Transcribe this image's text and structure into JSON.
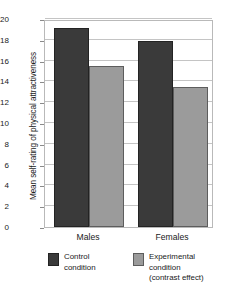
{
  "chart_data": {
    "type": "bar",
    "title": "",
    "xlabel": "",
    "ylabel": "Mean self-rating of physical attractiveness",
    "categories": [
      "Males",
      "Females"
    ],
    "series": [
      {
        "name": "Control condition",
        "values": [
          19.1,
          17.9
        ],
        "color": "#3a3a3a"
      },
      {
        "name": "Experimental condition (contrast effect)",
        "values": [
          15.5,
          13.5
        ],
        "color": "#9b9b9b"
      }
    ],
    "ylim": [
      0,
      20
    ],
    "yticks": [
      0,
      2,
      4,
      6,
      8,
      10,
      12,
      14,
      16,
      18,
      20
    ],
    "ytick_labels": [
      "0",
      "2",
      "4",
      "6",
      "8",
      "10",
      "12",
      "14",
      "16",
      "18",
      "20"
    ],
    "grid": true,
    "legend_position": "bottom"
  },
  "legend": {
    "entries": [
      {
        "swatch": "dark",
        "lines": [
          "Control",
          "condition"
        ]
      },
      {
        "swatch": "light",
        "lines": [
          "Experimental",
          "condition",
          "(contrast effect)"
        ]
      }
    ]
  }
}
